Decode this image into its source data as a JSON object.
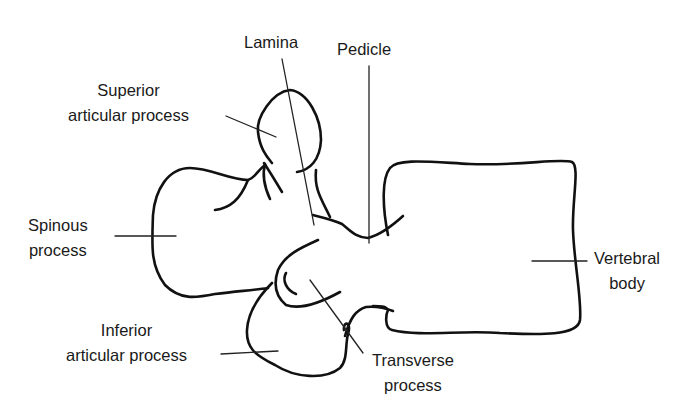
{
  "diagram": {
    "stroke_color": "#111111",
    "text_color": "#1a1a1a",
    "background": "#ffffff",
    "labels": {
      "lamina": {
        "lines": [
          "Lamina"
        ]
      },
      "pedicle": {
        "lines": [
          "Pedicle"
        ]
      },
      "superior_articular_process": {
        "lines": [
          "Superior",
          "articular process"
        ]
      },
      "spinous_process": {
        "lines": [
          "Spinous",
          "process"
        ]
      },
      "inferior_articular_process": {
        "lines": [
          "Inferior",
          "articular process"
        ]
      },
      "transverse_process": {
        "lines": [
          "Transverse",
          "process"
        ]
      },
      "vertebral_body": {
        "lines": [
          "Vertebral",
          "body"
        ]
      }
    }
  }
}
